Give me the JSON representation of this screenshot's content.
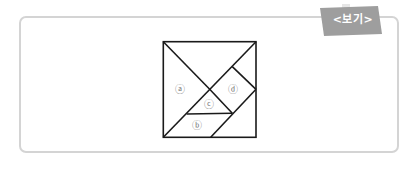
{
  "tag": {
    "label": "<보기>",
    "color": "#9e9e9e"
  },
  "figure": {
    "type": "tangram",
    "pieces": [
      {
        "id": "a",
        "label": "ⓐ",
        "shape": "large-triangle"
      },
      {
        "id": "b",
        "label": "ⓑ",
        "shape": "parallelogram"
      },
      {
        "id": "c",
        "label": "ⓒ",
        "shape": "small-triangle"
      },
      {
        "id": "d",
        "label": "ⓓ",
        "shape": "square"
      }
    ]
  }
}
